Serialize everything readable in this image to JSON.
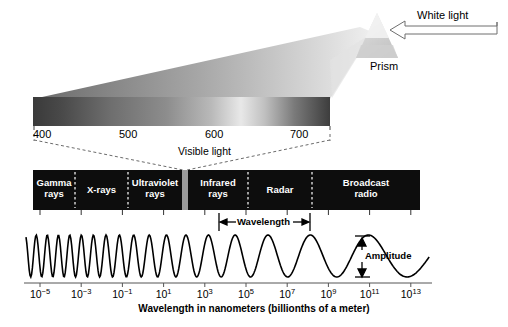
{
  "figure": {
    "caption": "Wavelength in nanometers (billionths of a meter)",
    "prism": {
      "white_light_label": "White light",
      "prism_label": "Prism"
    },
    "visible_scale": {
      "label": "Visible light",
      "ticks": [
        "400",
        "500",
        "600",
        "700"
      ]
    },
    "annotations": {
      "wavelength": "Wavelength",
      "amplitude": "Amplitude"
    }
  },
  "chart_data": {
    "type": "bar",
    "xlabel": "Wavelength in nanometers (billionths of a meter)",
    "ylabel": "",
    "x_scale": "log10",
    "xlim": [
      -6,
      14
    ],
    "grid": false,
    "legend": "none",
    "tick_labels": [
      "10-5",
      "10-3",
      "10-1",
      "101",
      "103",
      "105",
      "107",
      "109",
      "1011",
      "1013"
    ],
    "tick_mantissas": [
      "10",
      "10",
      "10",
      "10",
      "10",
      "10",
      "10",
      "10",
      "10",
      "10"
    ],
    "tick_exponents": [
      "−5",
      "−3",
      "−1",
      "1",
      "3",
      "5",
      "7",
      "9",
      "11",
      "13"
    ],
    "categories": [
      "Gamma rays",
      "X-rays",
      "Ultraviolet rays",
      "Visible light",
      "Infrared rays",
      "Radar",
      "Broadcast radio"
    ],
    "bands": [
      {
        "name": "Gamma rays",
        "line1": "Gamma",
        "line2": "rays",
        "x_start": 33,
        "x_end": 75,
        "color": "#0d0d0d"
      },
      {
        "name": "X-rays",
        "line1": "X-rays",
        "line2": "",
        "x_start": 75,
        "x_end": 128,
        "color": "#0d0d0d"
      },
      {
        "name": "Ultraviolet rays",
        "line1": "Ultraviolet",
        "line2": "rays",
        "x_start": 128,
        "x_end": 182,
        "color": "#0d0d0d"
      },
      {
        "name": "Visible light",
        "line1": "",
        "line2": "",
        "x_start": 182,
        "x_end": 188,
        "color": "#9a9a9a"
      },
      {
        "name": "Infrared rays",
        "line1": "Infrared",
        "line2": "rays",
        "x_start": 188,
        "x_end": 248,
        "color": "#0d0d0d"
      },
      {
        "name": "Radar",
        "line1": "Radar",
        "line2": "",
        "x_start": 248,
        "x_end": 312,
        "color": "#0d0d0d"
      },
      {
        "name": "Broadcast radio",
        "line1": "Broadcast",
        "line2": "radio",
        "x_start": 312,
        "x_end": 420,
        "color": "#0d0d0d"
      }
    ],
    "visible_spectrum_nm": [
      400,
      500,
      600,
      700
    ],
    "wave": {
      "description": "Sinusoid with wavelength increasing left to right",
      "amplitude_constant": true,
      "cycles": 11
    }
  },
  "colors": {
    "band_fill": "#0d0d0d",
    "band_text": "#ffffff",
    "visible_strip": "#9a9a9a",
    "axis": "#555555",
    "wave": "#000000",
    "background": "#ffffff"
  }
}
